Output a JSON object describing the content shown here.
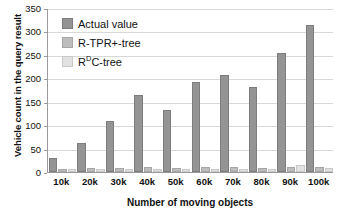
{
  "chart_data": {
    "type": "bar",
    "title": "",
    "categories": [
      "10k",
      "20k",
      "30k",
      "40k",
      "50k",
      "60k",
      "70k",
      "80k",
      "90k",
      "100k"
    ],
    "series": [
      {
        "name": "Actual value",
        "color": "#949494",
        "values": [
          25,
          57,
          105,
          160,
          128,
          188,
          202,
          178,
          250,
          310
        ]
      },
      {
        "name": "R-TPR+-tree",
        "color": "#bdbdbd",
        "values": [
          3,
          4,
          5,
          6,
          5,
          6,
          6,
          5,
          7,
          6
        ]
      },
      {
        "name": "RDC-tree",
        "color": "#e2e2e2",
        "values": [
          2,
          2,
          3,
          3,
          3,
          3,
          3,
          3,
          11,
          4
        ]
      }
    ],
    "xlabel": "Number of moving objects",
    "ylabel": "Vehicle count in the query result",
    "ylim": [
      0,
      350
    ],
    "yticks": [
      0,
      50,
      100,
      150,
      200,
      250,
      300,
      350
    ],
    "grid": true,
    "legend_position": "top-left"
  },
  "legend": {
    "items": [
      {
        "label": "Actual value",
        "sup": ""
      },
      {
        "label": "R-TPR+-tree",
        "sup": ""
      },
      {
        "label_pre": "R",
        "sup": "D",
        "label_post": "C-tree"
      }
    ]
  }
}
